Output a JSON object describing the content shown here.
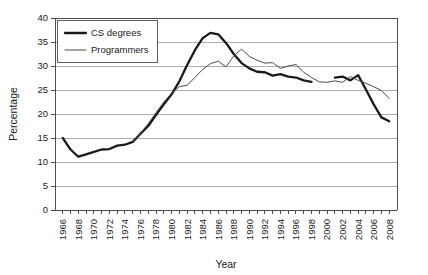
{
  "chart_data": {
    "type": "line",
    "title": "",
    "xlabel": "Year",
    "ylabel": "Percentage",
    "xlim": [
      1965,
      2009
    ],
    "ylim": [
      0,
      40
    ],
    "ytick_step": 5,
    "yticks": [
      0,
      5,
      10,
      15,
      20,
      25,
      30,
      35,
      40
    ],
    "grid": true,
    "grid_axis": "y",
    "legend_position": "top-left",
    "x": [
      1966,
      1967,
      1968,
      1969,
      1970,
      1971,
      1972,
      1973,
      1974,
      1975,
      1976,
      1977,
      1978,
      1979,
      1980,
      1981,
      1982,
      1983,
      1984,
      1985,
      1986,
      1987,
      1988,
      1989,
      1990,
      1991,
      1992,
      1993,
      1994,
      1995,
      1996,
      1997,
      1998,
      1999,
      2000,
      2001,
      2002,
      2003,
      2004,
      2005,
      2006,
      2007,
      2008
    ],
    "xticks": [
      1966,
      1968,
      1970,
      1972,
      1974,
      1976,
      1978,
      1980,
      1982,
      1984,
      1986,
      1988,
      1990,
      1992,
      1994,
      1996,
      1998,
      2000,
      2002,
      2004,
      2006,
      2008
    ],
    "xticklabels": [
      "1966",
      "1968",
      "1970",
      "1972",
      "1974",
      "1976",
      "1978",
      "1980",
      "1982",
      "1984",
      "1986",
      "1988",
      "1990",
      "1992",
      "1994",
      "1996",
      "1998",
      "2000",
      "2002",
      "2004",
      "2006",
      "2008"
    ],
    "series": [
      {
        "name": "CS degrees",
        "color": "#1a1a1a",
        "linewidth": 2.3,
        "values": [
          15.0,
          12.6,
          11.1,
          11.6,
          12.1,
          12.6,
          12.7,
          13.4,
          13.6,
          14.2,
          15.9,
          17.5,
          19.8,
          22.0,
          24.1,
          26.8,
          30.2,
          33.3,
          35.8,
          36.9,
          36.6,
          34.8,
          32.5,
          30.6,
          29.5,
          28.8,
          28.7,
          28.0,
          28.3,
          27.8,
          27.6,
          27.0,
          26.7,
          null,
          null,
          27.6,
          27.8,
          27.0,
          28.1,
          25.1,
          22.0,
          19.3,
          18.5
        ]
      },
      {
        "name": "Programmers",
        "color": "#4a4a4a",
        "linewidth": 1.0,
        "values": [
          null,
          null,
          null,
          null,
          null,
          null,
          null,
          null,
          null,
          14.2,
          16.0,
          18.0,
          20.3,
          22.5,
          24.3,
          25.7,
          26.0,
          27.6,
          29.3,
          30.5,
          31.0,
          29.8,
          32.1,
          33.5,
          32.0,
          31.2,
          30.6,
          30.7,
          29.5,
          30.0,
          30.3,
          28.7,
          27.6,
          26.7,
          26.6,
          26.9,
          26.6,
          27.8,
          27.0,
          26.4,
          25.7,
          24.9,
          23.2
        ]
      }
    ]
  },
  "legend": {
    "entries": [
      {
        "label": "CS degrees"
      },
      {
        "label": "Programmers"
      }
    ]
  },
  "axes": {
    "x_title": "Year",
    "y_title": "Percentage"
  }
}
